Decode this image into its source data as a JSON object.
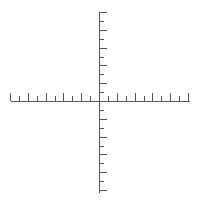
{
  "diagram": {
    "type": "coordinate-axes",
    "colors": {
      "background": "#ffffff",
      "axis": "#555555"
    },
    "origin": {
      "x": 99,
      "y": 101
    },
    "tick_spacing": 8.9,
    "x_axis": {
      "from": 11,
      "to": 189,
      "ticks_left": 10,
      "ticks_right": 10,
      "long_tick_length": 8,
      "short_tick_length": 5,
      "tick_direction": "up"
    },
    "y_axis": {
      "from": 12,
      "to": 192,
      "ticks_up": 10,
      "ticks_down": 10,
      "long_tick_length": 8,
      "short_tick_length": 5,
      "tick_direction": "right"
    },
    "labels": []
  }
}
